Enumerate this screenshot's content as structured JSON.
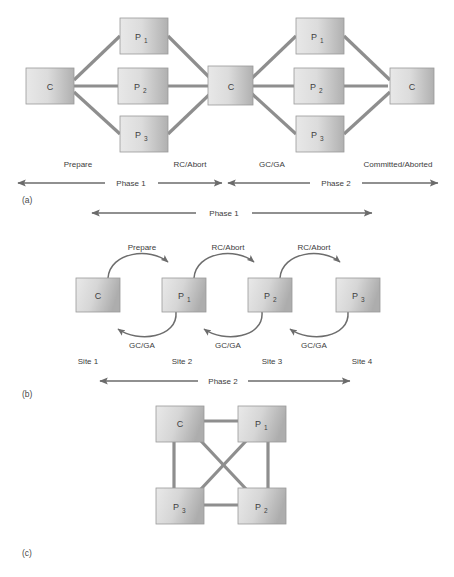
{
  "figure": {
    "parts": [
      {
        "key": "a",
        "label": "(a)"
      },
      {
        "key": "b",
        "label": "(b)"
      },
      {
        "key": "c",
        "label": "(c)"
      }
    ]
  },
  "nodes": {
    "coordinator": "C",
    "p1_base": "P",
    "p1_sub": "1",
    "p2_base": "P",
    "p2_sub": "2",
    "p3_base": "P",
    "p3_sub": "3"
  },
  "part_a": {
    "nodes": [
      {
        "name": "coordinator-left",
        "label": "C",
        "sub": ""
      },
      {
        "name": "participant-1-left",
        "label": "P",
        "sub": "1"
      },
      {
        "name": "participant-2-left",
        "label": "P",
        "sub": "2"
      },
      {
        "name": "participant-3-left",
        "label": "P",
        "sub": "3"
      },
      {
        "name": "coordinator-middle",
        "label": "C",
        "sub": ""
      },
      {
        "name": "participant-1-right",
        "label": "P",
        "sub": "1"
      },
      {
        "name": "participant-2-right",
        "label": "P",
        "sub": "2"
      },
      {
        "name": "participant-3-right",
        "label": "P",
        "sub": "3"
      },
      {
        "name": "coordinator-right",
        "label": "C",
        "sub": ""
      }
    ],
    "message_labels": {
      "prepare": "Prepare",
      "rc_abort": "RC/Abort",
      "gc_ga": "GC/GA",
      "committed_aborted": "Committed/Aborted"
    },
    "phase_labels": {
      "phase1": "Phase 1",
      "phase2": "Phase 2"
    }
  },
  "part_b": {
    "overall_phase": "Phase 1",
    "nodes": [
      {
        "name": "coordinator",
        "label": "C",
        "sub": ""
      },
      {
        "name": "participant-1",
        "label": "P",
        "sub": "1"
      },
      {
        "name": "participant-2",
        "label": "P",
        "sub": "2"
      },
      {
        "name": "participant-3",
        "label": "P",
        "sub": "3"
      }
    ],
    "top_labels": [
      "Prepare",
      "RC/Abort",
      "RC/Abort"
    ],
    "bottom_labels": [
      "GC/GA",
      "GC/GA",
      "GC/GA"
    ],
    "site_labels": [
      "Site 1",
      "Site 2",
      "Site 3",
      "Site 4"
    ],
    "phase_label": "Phase 2"
  },
  "part_c": {
    "nodes": [
      {
        "name": "coordinator",
        "label": "C",
        "sub": ""
      },
      {
        "name": "participant-1",
        "label": "P",
        "sub": "1"
      },
      {
        "name": "participant-2",
        "label": "P",
        "sub": "2"
      },
      {
        "name": "participant-3",
        "label": "P",
        "sub": "3"
      }
    ]
  },
  "colors": {
    "box_light": "#e4e4e4",
    "box_dark": "#b4b4b4",
    "box_border": "#9a9a9a",
    "link": "#8e8e8e",
    "arrow": "#6b6b6b",
    "text": "#3c3c3c",
    "background": "#ffffff"
  }
}
